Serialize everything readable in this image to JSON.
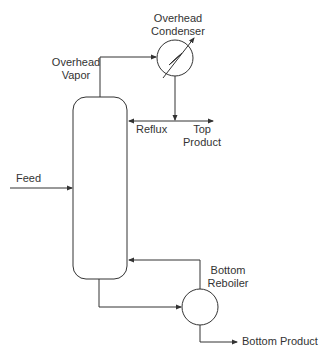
{
  "diagram": {
    "colors": {
      "line": "#333333",
      "text": "#333333",
      "background": "#ffffff"
    },
    "equipment": {
      "condenser": {
        "line1": "Overhead",
        "line2": "Condenser"
      },
      "reboiler": {
        "line1": "Bottom",
        "line2": "Reboiler"
      }
    },
    "streams": {
      "overhead_vapor": {
        "line1": "Overhead",
        "line2": "Vapor"
      },
      "reflux": "Reflux",
      "top_product": {
        "line1": "Top",
        "line2": "Product"
      },
      "feed": "Feed",
      "bottom_product": "Bottom Product"
    }
  }
}
